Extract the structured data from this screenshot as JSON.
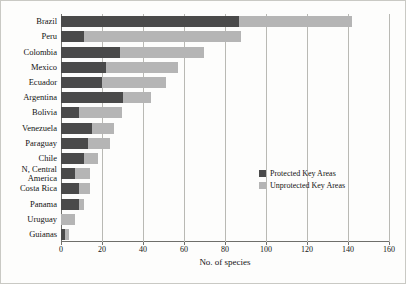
{
  "chart_data": {
    "type": "bar",
    "orientation": "horizontal",
    "stacked": true,
    "title": "",
    "xlabel": "No. of species",
    "ylabel": "",
    "xlim": [
      0,
      160
    ],
    "xticks": [
      0,
      20,
      40,
      60,
      80,
      100,
      120,
      140,
      160
    ],
    "grid": true,
    "legend_position": "right-middle",
    "categories": [
      "Brazil",
      "Peru",
      "Colombia",
      "Mexico",
      "Ecuador",
      "Argentina",
      "Bolivia",
      "Venezuela",
      "Paraguay",
      "Chile",
      "N, Central America",
      "Costa Rica",
      "Panama",
      "Uruguay",
      "Guianas"
    ],
    "series": [
      {
        "name": "Protected Key Areas",
        "color": "#4a4a4a",
        "values": [
          87,
          11,
          29,
          22,
          20,
          30,
          9,
          15,
          13,
          11,
          7,
          9,
          9,
          0,
          2
        ]
      },
      {
        "name": "Unprotected Key Areas",
        "color": "#b5b5b5",
        "values": [
          55,
          77,
          41,
          35,
          31,
          14,
          21,
          11,
          11,
          7,
          7,
          5,
          2,
          7,
          2
        ]
      }
    ],
    "totals": [
      142,
      88,
      70,
      57,
      51,
      44,
      30,
      26,
      24,
      18,
      14,
      14,
      11,
      7,
      4
    ]
  },
  "legend": {
    "items": [
      {
        "label": "Protected Key Areas",
        "color": "#4a4a4a"
      },
      {
        "label": "Unprotected Key Areas",
        "color": "#b5b5b5"
      }
    ]
  }
}
